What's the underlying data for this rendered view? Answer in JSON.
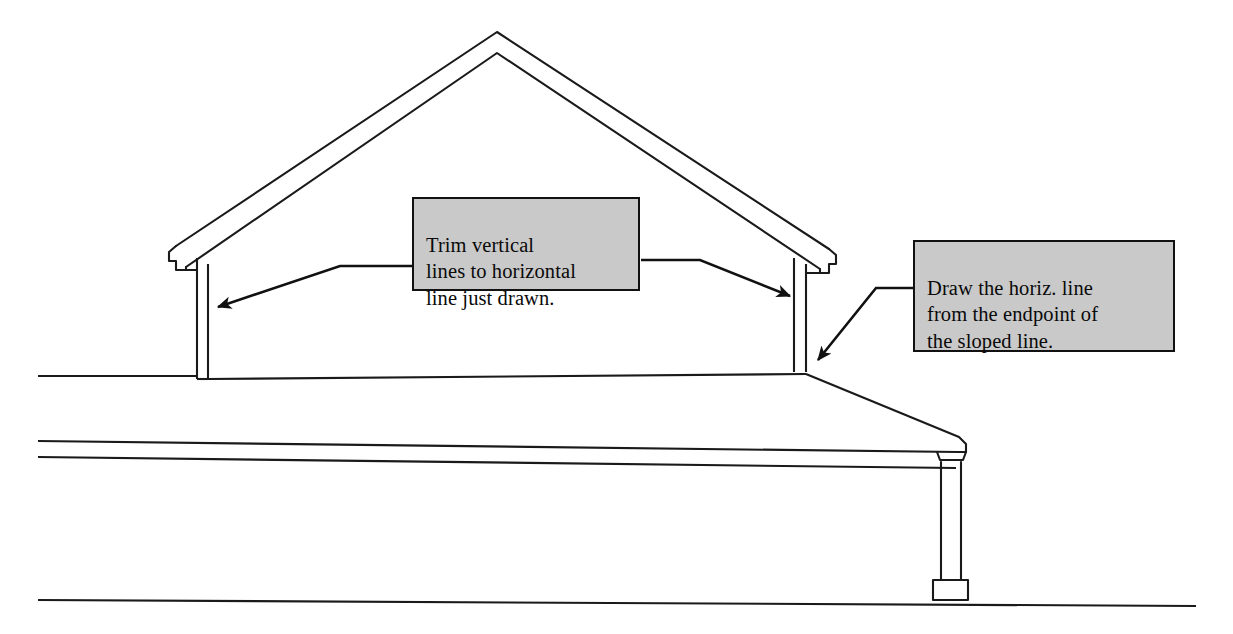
{
  "document": {
    "title": "Gable roof section — trim and draw instructions",
    "type": "architectural-line-drawing",
    "background_color": "#ffffff",
    "line_color": "#1a1a1a"
  },
  "callouts": [
    {
      "id": "trim",
      "text": "Trim vertical\nlines to horizontal\nline just drawn.",
      "fill_color": "#c9c9c9",
      "border_color": "#111111",
      "x": 412,
      "y": 197,
      "width": 228,
      "height": 94,
      "leaders": [
        {
          "name": "leader-to-left-wall",
          "points": "412,265 338,265 215,307",
          "arrow_at": "215,307",
          "arrow_angle": 199
        },
        {
          "name": "leader-to-right-wall",
          "points": "640,260 700,260 795,297",
          "arrow_at": "795,297",
          "arrow_angle": 21
        }
      ]
    },
    {
      "id": "draw",
      "text": "Draw the horiz. line\nfrom the endpoint of\nthe sloped line.",
      "fill_color": "#c9c9c9",
      "border_color": "#111111",
      "x": 913,
      "y": 240,
      "width": 262,
      "height": 112,
      "leaders": [
        {
          "name": "leader-to-eave-junction",
          "points": "913,288 878,288 816,362",
          "arrow_at": "816,362",
          "arrow_angle": 130
        }
      ]
    }
  ],
  "geometry": {
    "roof_peak": {
      "x": 497,
      "y": 32
    },
    "roof_outer_left": {
      "x": 176,
      "y": 237
    },
    "roof_outer_right": {
      "x": 829,
      "y": 240
    },
    "gable_left_wall": {
      "x_outer": 197,
      "x_inner": 208,
      "y_top": 258,
      "y_bottom": 379
    },
    "gable_right_wall": {
      "x_outer": 794,
      "x_inner": 806,
      "y_top": 258,
      "y_bottom": 372
    },
    "upper_ground_line": {
      "x1": 38,
      "x2": 197,
      "y": 376
    },
    "porch_roof_top": {
      "x1": 208,
      "y1": 379,
      "x2": 960,
      "y2": 437
    },
    "porch_roof_bottom": {
      "x1": 38,
      "y1": 443,
      "x2": 960,
      "y2": 457
    },
    "band_line_lower": {
      "x1": 38,
      "y1": 458,
      "x2": 958,
      "y2": 470
    },
    "porch_column": {
      "x_left": 941,
      "x_right": 962,
      "y_top": 462,
      "y_bottom": 588
    },
    "column_base": {
      "x_left": 935,
      "x_right": 968,
      "y_top": 578,
      "y_bottom": 598
    },
    "bottom_ground_line": {
      "x1": 38,
      "y1": 601,
      "x2": 1196,
      "y2": 606
    }
  }
}
